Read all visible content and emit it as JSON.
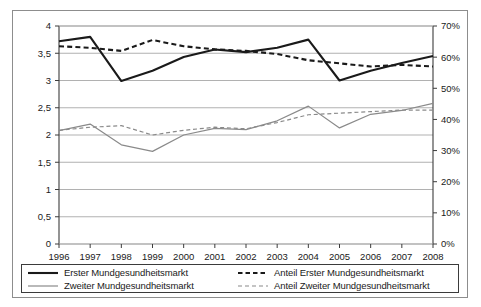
{
  "chart_data": {
    "type": "line",
    "title": "",
    "subtitle": "",
    "xlabel": "",
    "ylabel": "",
    "y2label": "",
    "grid": true,
    "legend_position": "bottom",
    "categories": [
      "1996",
      "1997",
      "1998",
      "1999",
      "2000",
      "2001",
      "2002",
      "2003",
      "2004",
      "2005",
      "2006",
      "2007",
      "2008"
    ],
    "x": [
      1996,
      1997,
      1998,
      1999,
      2000,
      2001,
      2002,
      2003,
      2004,
      2005,
      2006,
      2007,
      2008
    ],
    "ylim": [
      0,
      4
    ],
    "yticks": [
      0,
      0.5,
      1,
      1.5,
      2,
      2.5,
      3,
      3.5,
      4
    ],
    "ytick_labels": [
      "0",
      "0,5",
      "1",
      "1,5",
      "2",
      "2,5",
      "3",
      "3,5",
      "4"
    ],
    "y2lim": [
      0,
      70
    ],
    "y2ticks": [
      0,
      10,
      20,
      30,
      40,
      50,
      60,
      70
    ],
    "y2tick_labels": [
      "0%",
      "10%",
      "20%",
      "30%",
      "40%",
      "50%",
      "60%",
      "70%"
    ],
    "series": [
      {
        "name": "Erster Mundgesundheitsmarkt",
        "axis": "left",
        "color": "#1a1a1a",
        "style": "solid",
        "width": 2.1,
        "values": [
          3.72,
          3.8,
          2.99,
          3.18,
          3.43,
          3.57,
          3.52,
          3.6,
          3.75,
          3.0,
          3.18,
          3.32,
          3.45
        ]
      },
      {
        "name": "Zweiter Mundgesundheitsmarkt",
        "axis": "left",
        "color": "#8a8a8a",
        "style": "solid",
        "width": 1.2,
        "values": [
          2.08,
          2.2,
          1.82,
          1.7,
          2.0,
          2.12,
          2.1,
          2.26,
          2.53,
          2.13,
          2.38,
          2.45,
          2.58
        ]
      },
      {
        "name": "Anteil Erster Mundgesundheitsmarkt",
        "axis": "right",
        "color": "#1a1a1a",
        "style": "dashed",
        "width": 2.1,
        "values": [
          63.5,
          63.0,
          62.0,
          65.5,
          63.5,
          62.5,
          62.0,
          61.0,
          59.0,
          58.0,
          57.0,
          57.5,
          57.0
        ]
      },
      {
        "name": "Anteil Zweiter Mundgesundheitsmarkt",
        "axis": "right",
        "color": "#8a8a8a",
        "style": "dashed",
        "width": 1.2,
        "values": [
          36.5,
          37.5,
          38.0,
          35.0,
          36.5,
          37.5,
          37.0,
          39.0,
          41.5,
          42.0,
          42.5,
          43.0,
          43.0
        ]
      }
    ]
  },
  "legend": {
    "entries": [
      {
        "label": "Erster Mundgesundheitsmarkt",
        "color": "#1a1a1a",
        "style": "solid",
        "width": 2.1
      },
      {
        "label": "Anteil Erster Mundgesundheitsmarkt",
        "color": "#1a1a1a",
        "style": "dashed",
        "width": 2.1
      },
      {
        "label": "Zweiter Mundgesundheitsmarkt",
        "color": "#8a8a8a",
        "style": "solid",
        "width": 1.2
      },
      {
        "label": "Anteil Zweiter Mundgesundheitsmarkt",
        "color": "#8a8a8a",
        "style": "dashed",
        "width": 1.2
      }
    ]
  },
  "colors": {
    "frame": "#8d8d8d",
    "plot_border": "#3b3b3b",
    "gridline": "#a8a8a8",
    "text": "#1a1a1a",
    "background": "#ffffff"
  }
}
